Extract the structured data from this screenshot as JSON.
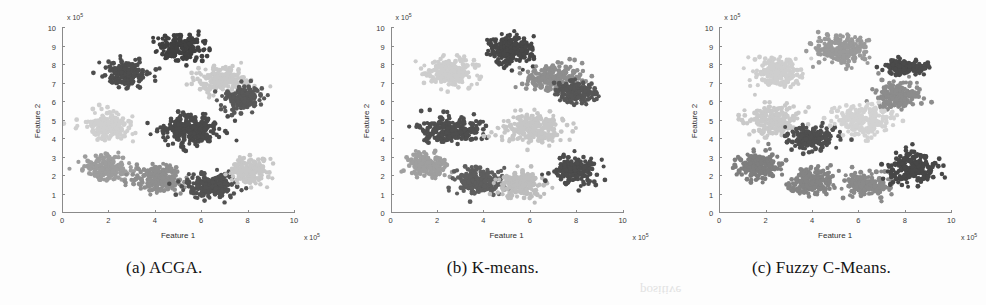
{
  "figure": {
    "background": "#fdfdfd",
    "bleed_artifact": "positive"
  },
  "palette": {
    "cluster_darkest": "#404040",
    "cluster_dark": "#585858",
    "cluster_mid": "#7d7d7d",
    "cluster_light": "#a6a6a6",
    "cluster_lighter": "#c4c4c4",
    "cluster_lightest": "#d8d8d8",
    "axis": "#8a8a8a",
    "text": "#2e2e2e"
  },
  "panels": [
    {
      "id": "panel-a",
      "caption": "(a) ACGA.",
      "chart_index": 0
    },
    {
      "id": "panel-b",
      "caption": "(b) K-means.",
      "chart_index": 1
    },
    {
      "id": "panel-c",
      "caption": "(c) Fuzzy C-Means.",
      "chart_index": 2
    }
  ],
  "chart_data": [
    {
      "type": "scatter",
      "title": "(a) ACGA.",
      "xlabel": "Feature 1",
      "ylabel": "Feature 2",
      "x_multiplier": "x 10^5",
      "y_multiplier": "x 10^5",
      "xlim": [
        0,
        10
      ],
      "ylim": [
        0,
        10
      ],
      "xticks": [
        0,
        2,
        4,
        6,
        8,
        10
      ],
      "yticks": [
        0,
        1,
        2,
        3,
        4,
        5,
        6,
        7,
        8,
        9,
        10
      ],
      "grid": false,
      "legend": "none",
      "n_clusters": 9,
      "series": [
        {
          "name": "cluster-1",
          "color": "#404040",
          "cx": 5.1,
          "cy": 8.9,
          "rx": 1.15,
          "ry": 0.85,
          "n": 210
        },
        {
          "name": "cluster-2",
          "color": "#4d4d4d",
          "cx": 2.7,
          "cy": 7.5,
          "rx": 1.15,
          "ry": 0.85,
          "n": 185
        },
        {
          "name": "cluster-3",
          "color": "#c9c9c9",
          "cx": 6.9,
          "cy": 7.2,
          "rx": 1.35,
          "ry": 0.85,
          "n": 200
        },
        {
          "name": "cluster-4",
          "color": "#585858",
          "cx": 7.8,
          "cy": 6.2,
          "rx": 1.05,
          "ry": 0.75,
          "n": 165
        },
        {
          "name": "cluster-5",
          "color": "#cfcfcf",
          "cx": 2.0,
          "cy": 4.7,
          "rx": 1.2,
          "ry": 0.85,
          "n": 195
        },
        {
          "name": "cluster-6",
          "color": "#4a4a4a",
          "cx": 5.6,
          "cy": 4.5,
          "rx": 1.5,
          "ry": 0.95,
          "n": 255
        },
        {
          "name": "cluster-7",
          "color": "#9d9d9d",
          "cx": 1.9,
          "cy": 2.4,
          "rx": 1.1,
          "ry": 0.85,
          "n": 190
        },
        {
          "name": "cluster-8",
          "color": "#8f8f8f",
          "cx": 4.2,
          "cy": 1.9,
          "rx": 1.2,
          "ry": 0.85,
          "n": 200
        },
        {
          "name": "cluster-9",
          "color": "#515151",
          "cx": 6.4,
          "cy": 1.5,
          "rx": 1.25,
          "ry": 0.8,
          "n": 215
        },
        {
          "name": "cluster-10",
          "color": "#c7c7c7",
          "cx": 8.1,
          "cy": 2.2,
          "rx": 1.0,
          "ry": 0.85,
          "n": 160
        }
      ]
    },
    {
      "type": "scatter",
      "title": "(b) K-means.",
      "xlabel": "Feature 1",
      "ylabel": "Feature 2",
      "x_multiplier": "x 10^5",
      "y_multiplier": "x 10^5",
      "xlim": [
        0,
        10
      ],
      "ylim": [
        0,
        10
      ],
      "xticks": [
        0,
        2,
        4,
        6,
        8,
        10
      ],
      "yticks": [
        0,
        1,
        2,
        3,
        4,
        5,
        6,
        7,
        8,
        9,
        10
      ],
      "grid": false,
      "legend": "none",
      "n_clusters": 9,
      "series": [
        {
          "name": "cluster-1",
          "color": "#474747",
          "cx": 5.2,
          "cy": 8.8,
          "rx": 1.2,
          "ry": 0.9,
          "n": 215
        },
        {
          "name": "cluster-2",
          "color": "#cdcdcd",
          "cx": 2.6,
          "cy": 7.6,
          "rx": 1.25,
          "ry": 0.9,
          "n": 200
        },
        {
          "name": "cluster-3",
          "color": "#8e8e8e",
          "cx": 7.0,
          "cy": 7.3,
          "rx": 1.4,
          "ry": 0.85,
          "n": 205
        },
        {
          "name": "cluster-4",
          "color": "#565656",
          "cx": 8.0,
          "cy": 6.5,
          "rx": 1.0,
          "ry": 0.7,
          "n": 150
        },
        {
          "name": "cluster-5",
          "color": "#4e4e4e",
          "cx": 2.6,
          "cy": 4.5,
          "rx": 1.45,
          "ry": 0.8,
          "n": 235
        },
        {
          "name": "cluster-6",
          "color": "#c6c6c6",
          "cx": 6.1,
          "cy": 4.6,
          "rx": 1.5,
          "ry": 1.0,
          "n": 245
        },
        {
          "name": "cluster-7",
          "color": "#9f9f9f",
          "cx": 1.6,
          "cy": 2.6,
          "rx": 1.05,
          "ry": 0.8,
          "n": 170
        },
        {
          "name": "cluster-8",
          "color": "#5e5e5e",
          "cx": 3.8,
          "cy": 1.7,
          "rx": 1.2,
          "ry": 0.85,
          "n": 205
        },
        {
          "name": "cluster-9",
          "color": "#bdbdbd",
          "cx": 5.6,
          "cy": 1.6,
          "rx": 1.15,
          "ry": 0.85,
          "n": 185
        },
        {
          "name": "cluster-10",
          "color": "#4c4c4c",
          "cx": 7.9,
          "cy": 2.3,
          "rx": 1.1,
          "ry": 0.9,
          "n": 190
        }
      ]
    },
    {
      "type": "scatter",
      "title": "(c) Fuzzy C-Means.",
      "xlabel": "Feature 1",
      "ylabel": "Feature 2",
      "x_multiplier": "x 10^5",
      "y_multiplier": "x 10^5",
      "xlim": [
        0,
        10
      ],
      "ylim": [
        0,
        10
      ],
      "xticks": [
        0,
        2,
        4,
        6,
        8,
        10
      ],
      "yticks": [
        0,
        1,
        2,
        3,
        4,
        5,
        6,
        7,
        8,
        9,
        10
      ],
      "grid": false,
      "legend": "none",
      "n_clusters": 9,
      "series": [
        {
          "name": "cluster-1",
          "color": "#9a9a9a",
          "cx": 5.3,
          "cy": 8.8,
          "rx": 1.25,
          "ry": 0.9,
          "n": 215
        },
        {
          "name": "cluster-2",
          "color": "#cecece",
          "cx": 2.5,
          "cy": 7.6,
          "rx": 1.25,
          "ry": 0.9,
          "n": 200
        },
        {
          "name": "cluster-3",
          "color": "#4a4a4a",
          "cx": 8.0,
          "cy": 7.9,
          "rx": 1.1,
          "ry": 0.45,
          "n": 150
        },
        {
          "name": "cluster-4",
          "color": "#8c8c8c",
          "cx": 7.7,
          "cy": 6.4,
          "rx": 1.15,
          "ry": 0.8,
          "n": 180
        },
        {
          "name": "cluster-5",
          "color": "#c9c9c9",
          "cx": 2.3,
          "cy": 5.0,
          "rx": 1.3,
          "ry": 0.95,
          "n": 215
        },
        {
          "name": "cluster-6",
          "color": "#4f4f4f",
          "cx": 4.0,
          "cy": 4.1,
          "rx": 1.2,
          "ry": 0.75,
          "n": 205
        },
        {
          "name": "cluster-7",
          "color": "#d2d2d2",
          "cx": 6.2,
          "cy": 5.0,
          "rx": 1.45,
          "ry": 1.0,
          "n": 230
        },
        {
          "name": "cluster-8",
          "color": "#7e7e7e",
          "cx": 1.7,
          "cy": 2.5,
          "rx": 1.1,
          "ry": 0.85,
          "n": 185
        },
        {
          "name": "cluster-9",
          "color": "#848484",
          "cx": 4.0,
          "cy": 1.7,
          "rx": 1.2,
          "ry": 0.85,
          "n": 205
        },
        {
          "name": "cluster-10",
          "color": "#8a8a8a",
          "cx": 6.3,
          "cy": 1.5,
          "rx": 1.15,
          "ry": 0.8,
          "n": 185
        },
        {
          "name": "cluster-11",
          "color": "#474747",
          "cx": 8.3,
          "cy": 2.4,
          "rx": 1.25,
          "ry": 0.95,
          "n": 220
        }
      ]
    }
  ]
}
